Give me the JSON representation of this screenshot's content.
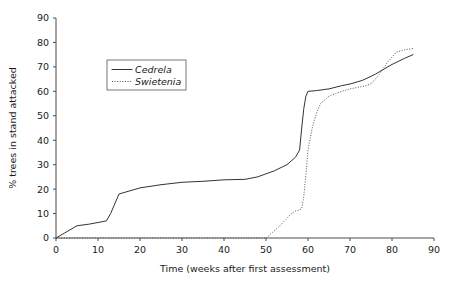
{
  "chart_data": {
    "type": "line",
    "title": "",
    "xlabel": "Time (weeks after first assessment)",
    "ylabel": "% trees in stand attacked",
    "xlim": [
      0,
      90
    ],
    "ylim": [
      0,
      90
    ],
    "xticks": [
      0,
      10,
      20,
      30,
      40,
      50,
      60,
      70,
      80,
      90
    ],
    "yticks": [
      0,
      10,
      20,
      30,
      40,
      50,
      60,
      70,
      80,
      90
    ],
    "xtick_labels": [
      "0",
      "10",
      "20",
      "30",
      "40",
      "50",
      "60",
      "70",
      "80",
      "90"
    ],
    "ytick_labels": [
      "0",
      "10",
      "20",
      "30",
      "40",
      "50",
      "60",
      "70",
      "80",
      "90"
    ],
    "grid": false,
    "legend_position": "upper left",
    "series": [
      {
        "name": "Cedrela",
        "style": "solid",
        "color": "#333333",
        "points": [
          [
            0,
            0
          ],
          [
            2,
            2
          ],
          [
            5,
            5
          ],
          [
            8,
            5.7
          ],
          [
            12,
            7
          ],
          [
            13,
            10
          ],
          [
            15,
            18
          ],
          [
            20,
            20.5
          ],
          [
            25,
            21.8
          ],
          [
            30,
            22.8
          ],
          [
            35,
            23.2
          ],
          [
            40,
            23.8
          ],
          [
            45,
            24
          ],
          [
            48,
            25
          ],
          [
            52,
            27.5
          ],
          [
            55,
            30
          ],
          [
            57,
            33
          ],
          [
            58,
            36
          ],
          [
            58.5,
            45
          ],
          [
            59,
            53
          ],
          [
            59.5,
            58
          ],
          [
            60,
            60
          ],
          [
            62,
            60.3
          ],
          [
            65,
            61
          ],
          [
            68,
            62.3
          ],
          [
            70,
            63
          ],
          [
            73,
            64.5
          ],
          [
            76,
            67
          ],
          [
            80,
            71
          ],
          [
            83,
            73.5
          ],
          [
            85,
            75
          ]
        ]
      },
      {
        "name": "Swietenia",
        "style": "dotted",
        "color": "#555555",
        "points": [
          [
            0,
            0
          ],
          [
            10,
            0
          ],
          [
            20,
            0
          ],
          [
            30,
            0
          ],
          [
            40,
            0
          ],
          [
            50,
            0
          ],
          [
            51,
            1.5
          ],
          [
            53,
            4.5
          ],
          [
            55,
            8
          ],
          [
            56,
            10
          ],
          [
            57,
            11
          ],
          [
            58,
            11.5
          ],
          [
            58.5,
            12
          ],
          [
            59,
            17
          ],
          [
            59.5,
            26
          ],
          [
            60,
            36
          ],
          [
            61,
            45
          ],
          [
            62,
            51
          ],
          [
            63,
            55
          ],
          [
            65,
            58
          ],
          [
            68,
            60
          ],
          [
            70,
            61
          ],
          [
            73,
            62
          ],
          [
            75,
            63
          ],
          [
            77,
            67
          ],
          [
            79,
            72
          ],
          [
            81,
            76
          ],
          [
            83,
            77
          ],
          [
            85,
            77.5
          ]
        ]
      }
    ]
  },
  "legend": {
    "entries": [
      {
        "label": "Cedrela",
        "style": "solid"
      },
      {
        "label": "Swietenia",
        "style": "dotted"
      }
    ]
  },
  "axes": {
    "x_title": "Time (weeks after first assessment)",
    "y_title": "% trees in stand attacked"
  }
}
